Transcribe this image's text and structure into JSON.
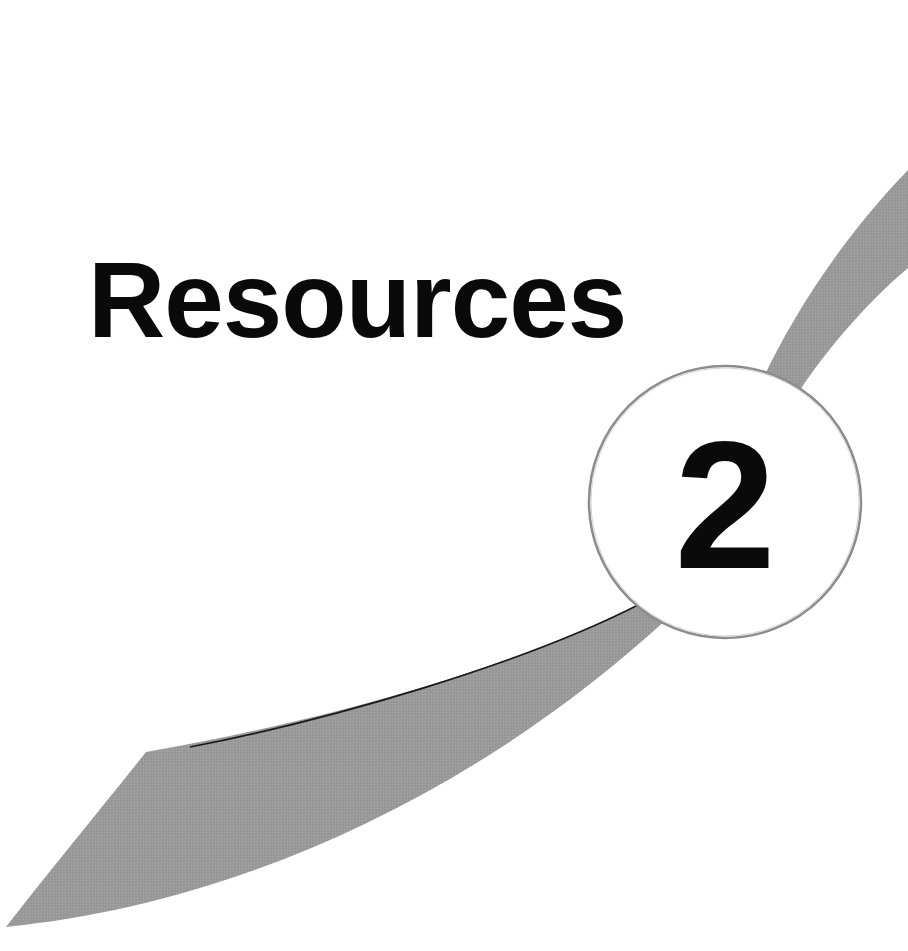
{
  "page": {
    "type": "chapter-opener",
    "title": "Resources",
    "chapter_number": "2"
  },
  "colors": {
    "background": "#ffffff",
    "title_text": "#0a0a0a",
    "swoosh_fill": "#9a9a9a",
    "swoosh_edge": "#1a1a1a",
    "circle_fill": "#ffffff",
    "circle_stroke": "#8c8c8c"
  }
}
